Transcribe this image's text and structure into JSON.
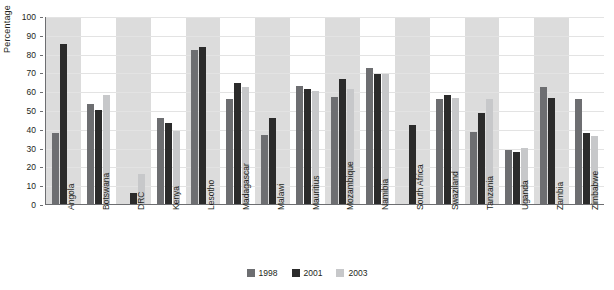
{
  "chart_data": {
    "type": "bar",
    "title": "",
    "xlabel": "",
    "ylabel": "Percentage",
    "ylim": [
      0,
      100
    ],
    "yticks": [
      0,
      10,
      20,
      30,
      40,
      50,
      60,
      70,
      80,
      90,
      100
    ],
    "grid": true,
    "legend_position": "bottom",
    "categories": [
      "Angola",
      "Botswana",
      "DRC",
      "Kenya",
      "Lesotho",
      "Madagascar",
      "Malawi",
      "Mauritius",
      "Mozambique",
      "Namibia",
      "South Africa",
      "Swaziland",
      "Tanzania",
      "Uganda",
      "Zambia",
      "Zimbabwe"
    ],
    "series": [
      {
        "name": "1998",
        "color": "#6d6e71",
        "values": [
          38,
          53,
          null,
          46,
          82,
          56,
          36.5,
          63,
          57,
          72.5,
          null,
          56,
          38.5,
          28.5,
          62.5,
          56
        ]
      },
      {
        "name": "2001",
        "color": "#2b2b2b",
        "values": [
          85,
          50,
          6,
          43,
          83.5,
          64.5,
          46,
          61,
          66.5,
          69,
          42,
          58,
          48.5,
          27.5,
          56.5,
          38
        ]
      },
      {
        "name": "2003",
        "color": "#c7c8ca",
        "values": [
          null,
          58,
          16,
          39,
          null,
          62.5,
          null,
          60,
          61,
          69,
          null,
          56.5,
          56,
          30,
          null,
          36
        ]
      }
    ],
    "band_color": "#dcdcdc"
  },
  "legend": {
    "items": [
      {
        "label": "1998",
        "color": "#6d6e71"
      },
      {
        "label": "2001",
        "color": "#2b2b2b"
      },
      {
        "label": "2003",
        "color": "#c7c8ca"
      }
    ]
  }
}
